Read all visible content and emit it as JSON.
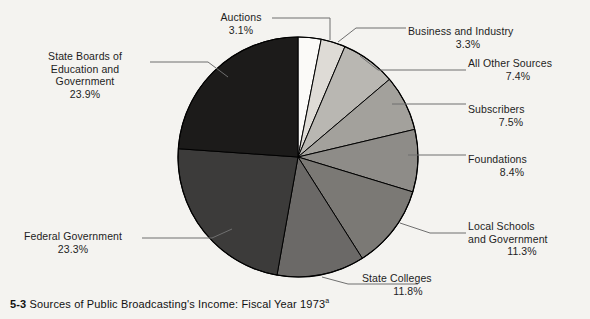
{
  "caption": {
    "number": "5-3",
    "text": "Sources of Public Broadcasting's Income: Fiscal Year 1973",
    "footnote_marker": "a"
  },
  "chart_data": {
    "type": "pie",
    "title": "Sources of Public Broadcasting's Income: Fiscal Year 1973",
    "units": "percent",
    "total": 100.0,
    "start_angle_deg": 0,
    "direction": "clockwise",
    "legend": "none",
    "grid": false,
    "labels": [
      "Auctions",
      "Business and Industry",
      "All Other Sources",
      "Subscribers",
      "Foundations",
      "Local Schools and Government",
      "State Colleges",
      "Federal Government",
      "State Boards of Education and Government"
    ],
    "values": [
      3.1,
      3.3,
      7.4,
      7.5,
      8.4,
      11.3,
      11.8,
      23.3,
      23.9
    ],
    "colors": [
      "#fbfaf8",
      "#dedbd6",
      "#b9b7b2",
      "#a3a19c",
      "#8e8c88",
      "#7b7975",
      "#6b6967",
      "#3c3b3a",
      "#1c1b1a"
    ],
    "slices": [
      {
        "label": "Auctions",
        "value": 3.1,
        "pct_text": "3.1%",
        "color": "#fbfaf8"
      },
      {
        "label": "Business and Industry",
        "value": 3.3,
        "pct_text": "3.3%",
        "color": "#dedbd6"
      },
      {
        "label": "All Other Sources",
        "value": 7.4,
        "pct_text": "7.4%",
        "color": "#b9b7b2"
      },
      {
        "label": "Subscribers",
        "value": 7.5,
        "pct_text": "7.5%",
        "color": "#a3a19c"
      },
      {
        "label": "Foundations",
        "value": 8.4,
        "pct_text": "8.4%",
        "color": "#8e8c88"
      },
      {
        "label": "Local Schools and Government",
        "value": 11.3,
        "pct_text": "11.3%",
        "color": "#7b7975"
      },
      {
        "label": "State Colleges",
        "value": 11.8,
        "pct_text": "11.8%",
        "color": "#6b6967"
      },
      {
        "label": "Federal Government",
        "value": 23.3,
        "pct_text": "23.3%",
        "color": "#3c3b3a"
      },
      {
        "label": "State Boards of Education and Government",
        "value": 23.9,
        "pct_text": "23.9%",
        "color": "#1c1b1a"
      }
    ]
  },
  "callouts": {
    "auctions": {
      "name": "Auctions",
      "pct": "3.1%"
    },
    "state_boards": {
      "line1": "State Boards of",
      "line2": "Education and",
      "line3": "Government",
      "pct": "23.9%"
    },
    "federal": {
      "name": "Federal Government",
      "pct": "23.3%"
    },
    "business": {
      "name": "Business and Industry",
      "pct": "3.3%"
    },
    "all_other": {
      "name": "All Other Sources",
      "pct": "7.4%"
    },
    "subscribers": {
      "name": "Subscribers",
      "pct": "7.5%"
    },
    "foundations": {
      "name": "Foundations",
      "pct": "8.4%"
    },
    "local_schools": {
      "line1": "Local Schools",
      "line2": "and Government",
      "pct": "11.3%"
    },
    "state_colleges": {
      "name": "State Colleges",
      "pct": "11.8%"
    }
  },
  "style": {
    "background": "#f4f3f0",
    "text_color": "#1d1d1d",
    "leader_color": "#6f6f6f",
    "slice_stroke": "#000000"
  }
}
